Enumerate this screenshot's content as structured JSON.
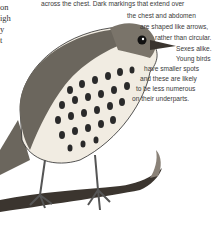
{
  "left_column": {
    "lines": [
      "on",
      "igh",
      "y",
      "t"
    ]
  },
  "caption": {
    "lines": [
      "across the chest. Dark markings that extend over",
      "the chest and abdomen",
      "are shaped like arrows,",
      "rather than circular.",
      "Sexes alike.",
      "Young birds",
      "have smaller spots",
      "and these are likely",
      "to be less numerous",
      "on their underparts."
    ]
  },
  "illustration": {
    "subject": "song thrush perched on branch",
    "colors": {
      "ink": "#2a2a2a",
      "breast": "#f1ece2",
      "back": "#6b665d",
      "branch": "#3b352f"
    }
  }
}
